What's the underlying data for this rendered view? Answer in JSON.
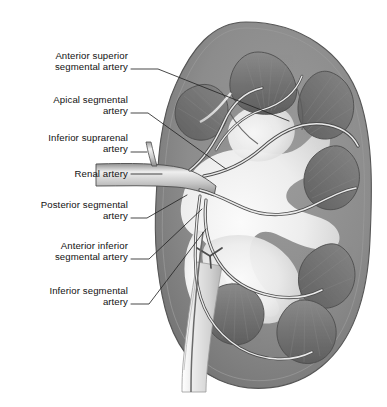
{
  "figure": {
    "view": "anterior coronal section",
    "background_color": "#ffffff",
    "ink_color": "#121212",
    "palette": {
      "cortex": "#8d8d8d",
      "cortex_dark": "#6f6f6f",
      "capsule_line": "#5a5a5a",
      "pyramid": "#7a7a7a",
      "pyramid_dark": "#636363",
      "sinus": "#f2f2f2",
      "column": "#d9d9d9",
      "artery_fill": "#cfcfcf",
      "artery_line": "#4a4a4a",
      "ureter": "#e3e3e3",
      "leader_line": "#2b2b2b"
    }
  },
  "labels": [
    {
      "id": "anterior-superior-segmental-artery",
      "text": "Anterior superior\nsegmental artery",
      "x": 20,
      "y": 50,
      "width": 108,
      "leader": "M131,69 L158,69 L289,121"
    },
    {
      "id": "apical-segmental-artery",
      "text": "Apical segmental\nartery",
      "x": 20,
      "y": 94,
      "width": 108,
      "leader": "M131,113 L148,113 L226,169"
    },
    {
      "id": "inferior-suprarenal-artery",
      "text": "Inferior suprarenal\nartery",
      "x": 14,
      "y": 132,
      "width": 114,
      "leader": "M131,152 L146,152"
    },
    {
      "id": "renal-artery",
      "text": "Renal artery",
      "x": 22,
      "y": 168,
      "width": 106,
      "leader": "M131,174 L160,174"
    },
    {
      "id": "posterior-segmental-artery",
      "text": "Posterior segmental\nartery",
      "x": 12,
      "y": 199,
      "width": 116,
      "leader": "M131,218 L146,218 L186,194"
    },
    {
      "id": "anterior-inferior-segmental-artery",
      "text": "Anterior inferior\nsegmental artery",
      "x": 22,
      "y": 240,
      "width": 106,
      "leader": "M131,259 L148,259 L201,208"
    },
    {
      "id": "inferior-segmental-artery",
      "text": "Inferior segmental\nartery",
      "x": 20,
      "y": 285,
      "width": 108,
      "leader": "M131,304 L148,304 L205,228"
    }
  ],
  "anatomy": {
    "outline_note": "bean-shaped kidney, hilum facing left",
    "pyramid_count": 7,
    "structures": [
      "renal cortex",
      "renal pyramid",
      "renal column",
      "renal sinus",
      "renal pelvis",
      "major calyx",
      "minor calyx",
      "ureter",
      "renal artery",
      "segmental arteries"
    ]
  }
}
